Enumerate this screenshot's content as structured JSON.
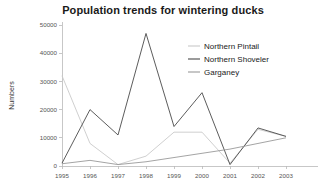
{
  "chart": {
    "title": "Population trends for wintering ducks",
    "ylabel": "Numbers",
    "xlabel": ""
  },
  "legend": {
    "items": [
      {
        "label": "Northern Pintail",
        "color": "#c9c9c9"
      },
      {
        "label": "Northern Shoveler",
        "color": "#4a4a4a"
      },
      {
        "label": "Garganey",
        "color": "#9a9a9a"
      }
    ]
  },
  "axes": {
    "y_ticks": [
      "0",
      "10000",
      "20000",
      "30000",
      "40000",
      "50000"
    ],
    "x_ticks": [
      "1995",
      "1996",
      "1997",
      "1998",
      "1999",
      "2000",
      "2001",
      "2002",
      "2003"
    ]
  },
  "chart_data": {
    "type": "line",
    "title": "Population trends for wintering ducks",
    "xlabel": "",
    "ylabel": "Numbers",
    "categories": [
      "1995",
      "1996",
      "1997",
      "1998",
      "1999",
      "2000",
      "2001",
      "2002",
      "2003"
    ],
    "ylim": [
      0,
      50000
    ],
    "xlim": [
      "1995",
      "2003"
    ],
    "grid": false,
    "legend_position": "upper-right",
    "series": [
      {
        "name": "Northern Pintail",
        "color": "#c9c9c9",
        "values": [
          32000,
          8000,
          500,
          3500,
          12000,
          12000,
          1000,
          13000,
          10500
        ]
      },
      {
        "name": "Northern Shoveler",
        "color": "#4a4a4a",
        "values": [
          1000,
          20000,
          11000,
          47000,
          14000,
          26000,
          500,
          13500,
          10500
        ]
      },
      {
        "name": "Garganey",
        "color": "#9a9a9a",
        "values": [
          800,
          2000,
          500,
          1500,
          3000,
          4500,
          6000,
          8000,
          10000
        ]
      }
    ]
  }
}
